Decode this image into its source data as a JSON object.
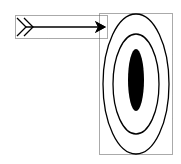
{
  "diagram": {
    "colors": {
      "stroke": "#000000",
      "fill_center": "#000000",
      "background": "#ffffff",
      "selection_border": "#555555"
    },
    "elements": [
      {
        "id": "arrow",
        "type": "arrow",
        "bbox": [
          15,
          15,
          107,
          38
        ],
        "selected": true
      },
      {
        "id": "target",
        "type": "target",
        "rings": 2,
        "bullseye": "filled",
        "bbox": [
          99,
          13,
          172,
          155
        ],
        "selected": true
      }
    ]
  }
}
